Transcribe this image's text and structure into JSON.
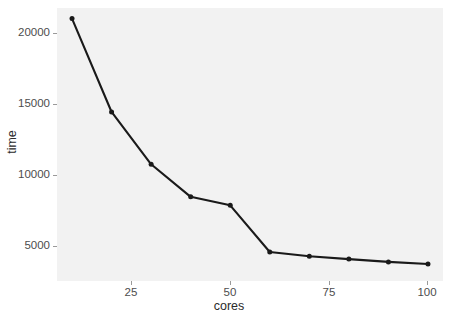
{
  "chart_data": {
    "type": "line",
    "title": "",
    "subtitle": "",
    "xlabel": "cores",
    "ylabel": "time",
    "x": [
      10,
      20,
      30,
      40,
      50,
      60,
      70,
      80,
      90,
      100
    ],
    "values": [
      20800,
      14200,
      10500,
      8200,
      7600,
      4300,
      4000,
      3800,
      3600,
      3450
    ],
    "series": [
      {
        "name": "time",
        "x": [
          10,
          20,
          30,
          40,
          50,
          60,
          70,
          80,
          90,
          100
        ],
        "values": [
          20800,
          14200,
          10500,
          8200,
          7600,
          4300,
          4000,
          3800,
          3600,
          3450
        ]
      }
    ],
    "xlim": [
      6.2,
      103.8
    ],
    "ylim": [
      2250,
      21550
    ],
    "xticks": [
      25,
      50,
      75,
      100
    ],
    "xtick_labels": [
      "25",
      "50",
      "75",
      "100"
    ],
    "yticks": [
      5000,
      10000,
      15000,
      20000
    ],
    "ytick_labels": [
      "5000",
      "10000",
      "15000",
      "20000"
    ],
    "grid": false,
    "legend": false,
    "legend_position": "none",
    "markers": true,
    "marker_shape": "circle",
    "line_color": "#1a1a1a",
    "marker_color": "#1a1a1a",
    "panel_background": "#f2f2f2",
    "plot_background": "#ffffff",
    "tick_label_color": "#4d4d4d",
    "axis_title_color": "#2b2b2b"
  }
}
